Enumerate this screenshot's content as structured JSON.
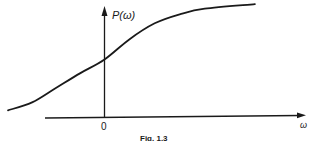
{
  "figure": {
    "caption": "Fig. 1.3",
    "y_axis_label": "P(ω)",
    "x_axis_label": "ω",
    "origin_label": "0",
    "curve_description": "sigmoid-shaped monotonically increasing curve P(ω), nonzero at ω=0, saturating for large ω",
    "colors": {
      "ink": "#1a1a1a",
      "background": "#ffffff"
    }
  },
  "chart_data": {
    "type": "line",
    "title": "",
    "caption": "Fig. 1.3",
    "xlabel": "ω",
    "ylabel": "P(ω)",
    "x_ticks": [
      "0"
    ],
    "y_ticks": [],
    "grid": false,
    "legend": "none",
    "series": [
      {
        "name": "P(ω)",
        "x": [
          -1.0,
          -0.75,
          -0.5,
          -0.25,
          0.0,
          0.25,
          0.5,
          0.75,
          1.0,
          1.5
        ],
        "y": [
          0.05,
          0.12,
          0.25,
          0.38,
          0.5,
          0.68,
          0.82,
          0.9,
          0.95,
          0.99
        ]
      }
    ],
    "xlim": [
      -1.0,
      2.0
    ],
    "ylim": [
      0,
      1.0
    ]
  }
}
